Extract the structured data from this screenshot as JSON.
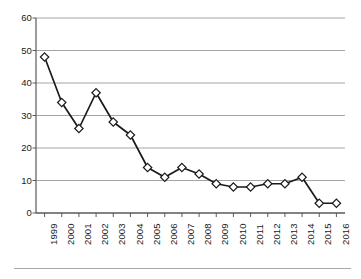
{
  "chart_data": {
    "type": "line",
    "title": "",
    "subtitle": "",
    "xlabel": "",
    "ylabel": "",
    "categories": [
      "1999",
      "2000",
      "2001",
      "2002",
      "2003",
      "2004",
      "2005",
      "2006",
      "2007",
      "2008",
      "2009",
      "2010",
      "2011",
      "2012",
      "2013",
      "2014",
      "2015",
      "2016"
    ],
    "values": [
      48,
      34,
      26,
      37,
      28,
      24,
      14,
      11,
      14,
      12,
      9,
      8,
      8,
      9,
      9,
      11,
      3,
      3
    ],
    "ylim": [
      0,
      60
    ],
    "y_ticks": [
      0,
      10,
      20,
      30,
      40,
      50,
      60
    ],
    "y_tick_labels": [
      "0",
      "10",
      "20",
      "30",
      "40",
      "50",
      "60"
    ],
    "grid": "horizontal",
    "legend": "none",
    "marker": "open-diamond",
    "x_tick_label_rotation": -90,
    "series": [
      {
        "name": "",
        "values": [
          48,
          34,
          26,
          37,
          28,
          24,
          14,
          11,
          14,
          12,
          9,
          8,
          8,
          9,
          9,
          11,
          3,
          3
        ]
      }
    ]
  },
  "style": {
    "line_color": "#1a1a1a",
    "marker_fill": "#ffffff",
    "marker_stroke": "#1a1a1a",
    "grid_color": "#9a9a9a",
    "axis_color": "#5a5a5a",
    "background": "#ffffff",
    "rule_color": "#a8a8a8"
  }
}
